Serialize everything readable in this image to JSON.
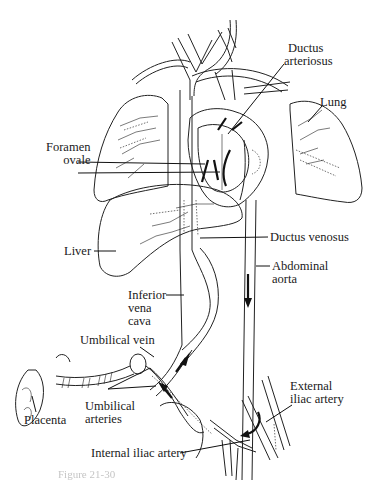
{
  "figure": {
    "labels": {
      "ductus_arteriosus": [
        "Ductus",
        "arteriosus"
      ],
      "lung": "Lung",
      "foramen_ovale": [
        "Foramen",
        "ovale"
      ],
      "liver": "Liver",
      "ductus_venosus": "Ductus venosus",
      "abdominal_aorta": [
        "Abdominal",
        "aorta"
      ],
      "inferior_vena_cava": [
        "Inferior",
        "vena",
        "cava"
      ],
      "umbilical_vein": "Umbilical vein",
      "umbilical_arteries": [
        "Umbilical",
        "arteries"
      ],
      "placenta": "Placenta",
      "external_iliac_artery": [
        "External",
        "iliac artery"
      ],
      "internal_iliac_artery": "Internal iliac artery"
    },
    "caption": "Figure 21-30"
  }
}
